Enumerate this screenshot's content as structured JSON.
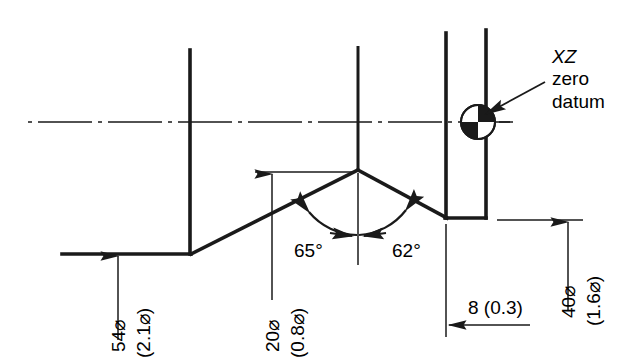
{
  "drawing": {
    "title": "Turned component profile with XZ zero datum",
    "colors": {
      "line": "#1a1a1a",
      "background": "#ffffff",
      "text": "#000000"
    },
    "leader_note": {
      "line1": "XZ",
      "line2": "zero",
      "line3": "datum"
    },
    "datum_symbol": {
      "name": "xz-zero-datum-symbol",
      "description": "quadrant-filled circle"
    },
    "dimensions": [
      {
        "id": "dia-54",
        "value": "54⌀",
        "alt": "(2.1⌀)",
        "orientation": "vertical"
      },
      {
        "id": "dia-20",
        "value": "20⌀",
        "alt": "(0.8⌀)",
        "orientation": "vertical"
      },
      {
        "id": "dia-40",
        "value": "40⌀",
        "alt": "(1.6⌀)",
        "orientation": "vertical"
      },
      {
        "id": "len-8",
        "value": "8 (0.3)",
        "orientation": "horizontal"
      }
    ],
    "angles": [
      {
        "id": "angle-left",
        "value": "65°"
      },
      {
        "id": "angle-right",
        "value": "62°"
      }
    ]
  }
}
